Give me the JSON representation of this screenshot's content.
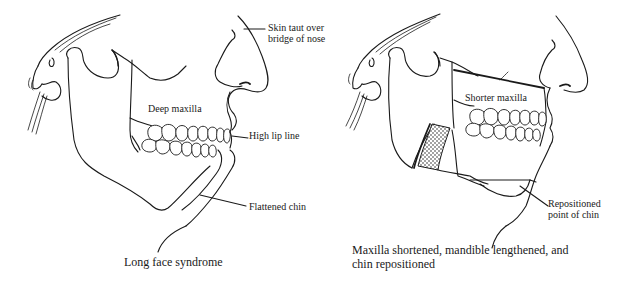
{
  "figure": {
    "panels": [
      {
        "id": "before",
        "caption": "Long face syndrome",
        "labels": {
          "skin": "Skin taut over",
          "skin_line2": "bridge of nose",
          "maxilla": "Deep maxilla",
          "lip": "High lip line",
          "chin": "Flattened chin"
        }
      },
      {
        "id": "after",
        "caption_line1": "Maxilla shortened, mandible lengthened, and",
        "caption_line2": "chin repositioned",
        "labels": {
          "maxilla": "Shorter maxilla",
          "chin": "Repositioned",
          "chin_line2": "point of chin"
        }
      }
    ],
    "icons": {
      "left_skull": "skull-profile-illustration",
      "right_skull": "skull-profile-surgical-illustration",
      "bone_graft": "stippled-bone-graft"
    }
  }
}
